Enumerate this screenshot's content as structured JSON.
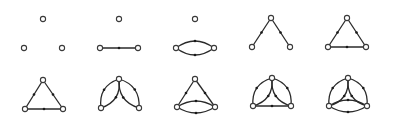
{
  "diagram": {
    "colors": {
      "edge": "#2a2a2a",
      "node_stroke": "#3a3a3a",
      "node_fill": "#ffffff",
      "background": "#ffffff"
    },
    "node_radius": 2.6,
    "figures": [
      {
        "id": "fig1",
        "nodes": [
          [
            43,
            19
          ],
          [
            24,
            48
          ],
          [
            62,
            48
          ]
        ],
        "edges": []
      },
      {
        "id": "fig2",
        "nodes": [
          [
            119,
            19
          ],
          [
            100,
            48
          ],
          [
            138,
            48
          ]
        ],
        "edges": [
          {
            "from": 1,
            "to": 2,
            "bend": 0,
            "arrow": "mark at midpoint"
          }
        ]
      },
      {
        "id": "fig3",
        "nodes": [
          [
            195,
            19
          ],
          [
            176,
            48
          ],
          [
            214,
            48
          ]
        ],
        "edges": [
          {
            "from": 1,
            "to": 2,
            "bend": -7,
            "arrow": "mark at midpoint"
          },
          {
            "from": 1,
            "to": 2,
            "bend": 7,
            "arrow": "mark at midpoint"
          }
        ]
      },
      {
        "id": "fig4",
        "nodes": [
          [
            271,
            18
          ],
          [
            252,
            47
          ],
          [
            290,
            47
          ]
        ],
        "edges": [
          {
            "from": 0,
            "to": 1,
            "bend": 0,
            "arrow": "mark at midpoint"
          },
          {
            "from": 0,
            "to": 2,
            "bend": 0,
            "arrow": "mark at midpoint"
          }
        ]
      },
      {
        "id": "fig5",
        "nodes": [
          [
            347,
            18
          ],
          [
            328,
            47
          ],
          [
            366,
            47
          ]
        ],
        "edges": [
          {
            "from": 0,
            "to": 1,
            "bend": 0,
            "arrow": "mark at midpoint"
          },
          {
            "from": 0,
            "to": 2,
            "bend": 0,
            "arrow": "mark at midpoint"
          },
          {
            "from": 1,
            "to": 2,
            "bend": 0,
            "arrow": "mark at midpoint"
          }
        ]
      },
      {
        "id": "fig6",
        "nodes": [
          [
            43,
            80
          ],
          [
            25,
            109
          ],
          [
            63,
            109
          ]
        ],
        "edges": [
          {
            "from": 0,
            "to": 1,
            "bend": 0,
            "arrow": "mark at midpoint"
          },
          {
            "from": 0,
            "to": 2,
            "bend": 0,
            "arrow": "mark at midpoint"
          },
          {
            "from": 1,
            "to": 2,
            "bend": 0,
            "arrow": "mark at midpoint"
          }
        ]
      },
      {
        "id": "fig7",
        "nodes": [
          [
            119,
            79
          ],
          [
            101,
            108
          ],
          [
            139,
            108
          ]
        ],
        "edges": [
          {
            "from": 0,
            "to": 1,
            "bend": -7,
            "arrow": "mark at midpoint"
          },
          {
            "from": 0,
            "to": 1,
            "bend": 7,
            "arrow": "mark at midpoint"
          },
          {
            "from": 0,
            "to": 2,
            "bend": -7,
            "arrow": "mark at midpoint"
          },
          {
            "from": 0,
            "to": 2,
            "bend": 7,
            "arrow": "mark at midpoint"
          }
        ]
      },
      {
        "id": "fig8",
        "nodes": [
          [
            195,
            79
          ],
          [
            177,
            107
          ],
          [
            215,
            107
          ]
        ],
        "edges": [
          {
            "from": 0,
            "to": 1,
            "bend": 0,
            "arrow": "mark at midpoint"
          },
          {
            "from": 0,
            "to": 2,
            "bend": 0,
            "arrow": "mark at midpoint"
          },
          {
            "from": 1,
            "to": 2,
            "bend": -6,
            "arrow": "mark at midpoint"
          },
          {
            "from": 1,
            "to": 2,
            "bend": 6,
            "arrow": "mark at midpoint"
          }
        ]
      },
      {
        "id": "fig9",
        "nodes": [
          [
            272,
            78
          ],
          [
            253,
            106
          ],
          [
            291,
            106
          ]
        ],
        "edges": [
          {
            "from": 0,
            "to": 1,
            "bend": -7,
            "arrow": "mark at midpoint"
          },
          {
            "from": 0,
            "to": 1,
            "bend": 7,
            "arrow": "mark at midpoint"
          },
          {
            "from": 0,
            "to": 2,
            "bend": -7,
            "arrow": "mark at midpoint"
          },
          {
            "from": 0,
            "to": 2,
            "bend": 7,
            "arrow": "mark at midpoint"
          },
          {
            "from": 1,
            "to": 2,
            "bend": 0,
            "arrow": "mark at midpoint"
          }
        ]
      },
      {
        "id": "fig10",
        "nodes": [
          [
            348,
            78
          ],
          [
            329,
            106
          ],
          [
            367,
            106
          ]
        ],
        "edges": [
          {
            "from": 0,
            "to": 1,
            "bend": -7,
            "arrow": "mark at midpoint"
          },
          {
            "from": 0,
            "to": 1,
            "bend": 7,
            "arrow": "mark at midpoint"
          },
          {
            "from": 0,
            "to": 2,
            "bend": -7,
            "arrow": "mark at midpoint"
          },
          {
            "from": 0,
            "to": 2,
            "bend": 7,
            "arrow": "mark at midpoint"
          },
          {
            "from": 1,
            "to": 2,
            "bend": -6,
            "arrow": "mark at midpoint"
          },
          {
            "from": 1,
            "to": 2,
            "bend": 6,
            "arrow": "mark at midpoint"
          }
        ]
      }
    ]
  }
}
